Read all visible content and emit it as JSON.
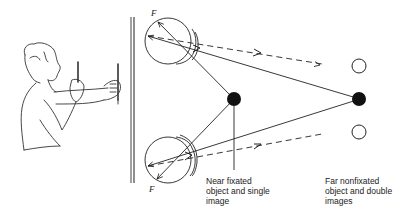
{
  "diagram": {
    "type": "binocular-vision-physiological-diplopia",
    "labels": {
      "fovea_top": "F",
      "fovea_bottom": "F",
      "near_object": "Near fixated\nobject and single\nimage",
      "far_object": "Far nonfixated\nobject and double\nimages"
    },
    "elements": {
      "figure": "person holding two pencils at arm's length",
      "wall": "vertical double line",
      "eyes": [
        "top eye",
        "bottom eye"
      ],
      "near_object": "filled circle (fixated)",
      "far_object": "filled circle (nonfixated)",
      "double_images": [
        "hollow circle top",
        "hollow circle bottom"
      ]
    },
    "colors": {
      "stroke": "#222222",
      "fill": "#111111",
      "background": "#ffffff"
    }
  }
}
